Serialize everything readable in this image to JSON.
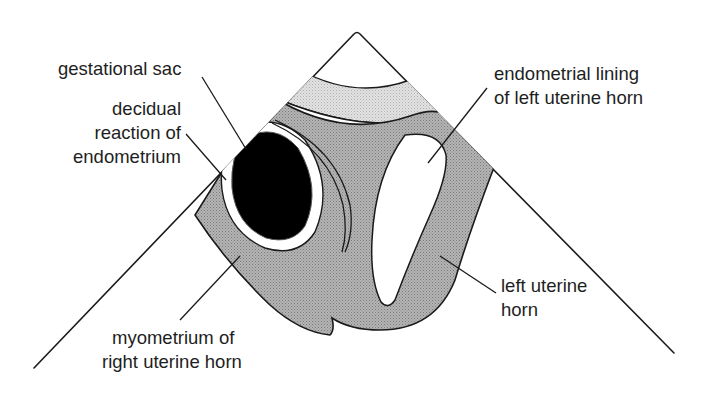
{
  "diagram": {
    "colors": {
      "background": "#ffffff",
      "outline": "#1a1a1a",
      "myometrium_fill": "#a9a9a9",
      "upper_band_fill": "#d9d9d9",
      "gestational_sac_fill": "#000000",
      "lining_fill": "#ffffff"
    },
    "labels": {
      "gestational_sac": "gestational sac",
      "decidual_1": "decidual",
      "decidual_2": "reaction of",
      "decidual_3": "endometrium",
      "endometrial_1": "endometrial lining",
      "endometrial_2": "of left uterine horn",
      "left_horn_1": "left uterine",
      "left_horn_2": "horn",
      "myometrium_1": "myometrium of",
      "myometrium_2": "right uterine horn"
    },
    "sector": {
      "apex": [
        357,
        33
      ],
      "left_end": [
        34,
        368
      ],
      "right_end": [
        674,
        353
      ]
    }
  }
}
